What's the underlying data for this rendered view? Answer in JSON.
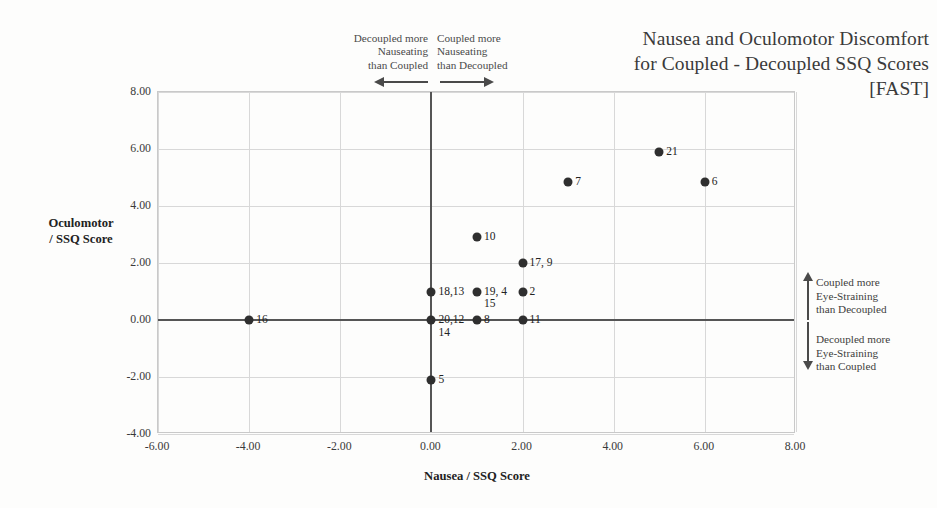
{
  "chart_data": {
    "type": "scatter",
    "title": [
      "Nausea and Oculomotor Discomfort",
      "for Coupled - Decoupled SSQ Scores",
      "[FAST]"
    ],
    "xlabel": "Nausea / SSQ Score",
    "ylabel": "Oculomotor\n/ SSQ Score",
    "ylabel_line1": "Oculomotor",
    "ylabel_line2": "/ SSQ Score",
    "xlim": [
      -6,
      8
    ],
    "ylim": [
      -4,
      8
    ],
    "xticks": [
      "-6.00",
      "-4.00",
      "-2.00",
      "0.00",
      "2.00",
      "4.00",
      "6.00",
      "8.00"
    ],
    "yticks": [
      "8.00",
      "6.00",
      "4.00",
      "2.00",
      "0.00",
      "-2.00",
      "-4.00"
    ],
    "xtick_values": [
      -6,
      -4,
      -2,
      0,
      2,
      4,
      6,
      8
    ],
    "ytick_values": [
      8,
      6,
      4,
      2,
      0,
      -2,
      -4
    ],
    "grid": true,
    "legend": "none",
    "marker_color": "#2f2f2f",
    "points": [
      {
        "label": "16",
        "x": -4,
        "y": 0.0,
        "label_lines": [
          "16"
        ]
      },
      {
        "label": "5",
        "x": 0,
        "y": -2.1,
        "label_lines": [
          "5"
        ]
      },
      {
        "label": "20,12 14",
        "x": 0,
        "y": 0.0,
        "label_lines": [
          "20,12",
          "14"
        ]
      },
      {
        "label": "18,13",
        "x": 0,
        "y": 1.0,
        "label_lines": [
          "18,13"
        ]
      },
      {
        "label": "8",
        "x": 1,
        "y": 0.0,
        "label_lines": [
          "8"
        ]
      },
      {
        "label": "19, 4 15",
        "x": 1,
        "y": 1.0,
        "label_lines": [
          "19, 4",
          "15"
        ]
      },
      {
        "label": "10",
        "x": 1,
        "y": 2.9,
        "label_lines": [
          "10"
        ]
      },
      {
        "label": "11",
        "x": 2,
        "y": 0.0,
        "label_lines": [
          "11"
        ]
      },
      {
        "label": "2",
        "x": 2,
        "y": 1.0,
        "label_lines": [
          "2"
        ]
      },
      {
        "label": "17, 9",
        "x": 2,
        "y": 2.0,
        "label_lines": [
          "17, 9"
        ]
      },
      {
        "label": "7",
        "x": 3,
        "y": 4.85,
        "label_lines": [
          "7"
        ]
      },
      {
        "label": "21",
        "x": 5,
        "y": 5.9,
        "label_lines": [
          "21"
        ]
      },
      {
        "label": "6",
        "x": 6,
        "y": 4.85,
        "label_lines": [
          "6"
        ]
      }
    ],
    "annotations": {
      "top_left": [
        "Decoupled more",
        "Nauseating",
        "than Coupled"
      ],
      "top_right": [
        "Coupled more",
        "Nauseating",
        "than Decoupled"
      ],
      "right_top": [
        "Coupled more",
        "Eye-Straining",
        "than Decoupled"
      ],
      "right_bottom": [
        "Decoupled more",
        "Eye-Straining",
        "than Coupled"
      ]
    }
  }
}
